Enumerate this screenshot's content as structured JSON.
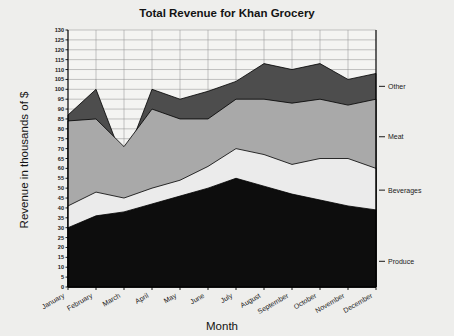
{
  "chart_data": {
    "type": "area",
    "stacked": true,
    "title": "Total Revenue for Khan Grocery",
    "xlabel": "Month",
    "ylabel": "Revenue in thousands of $",
    "categories": [
      "January",
      "February",
      "March",
      "April",
      "May",
      "June",
      "July",
      "August",
      "September",
      "October",
      "November",
      "December"
    ],
    "ylim": [
      0,
      130
    ],
    "ytick_step": 5,
    "yticks": [
      0,
      5,
      10,
      15,
      20,
      25,
      30,
      35,
      40,
      45,
      50,
      55,
      60,
      65,
      70,
      75,
      80,
      85,
      90,
      95,
      100,
      105,
      110,
      115,
      120,
      125,
      130
    ],
    "grid": true,
    "legend_position": "right-inline",
    "series": [
      {
        "name": "Produce",
        "color": "#0d0d0d",
        "values": [
          30,
          36,
          38,
          42,
          46,
          50,
          55,
          51,
          47,
          44,
          41,
          39
        ],
        "cumulative": [
          30,
          36,
          38,
          42,
          46,
          50,
          55,
          51,
          47,
          44,
          41,
          39
        ]
      },
      {
        "name": "Beverages",
        "color": "#ebebeb",
        "values": [
          11,
          12,
          7,
          8,
          8,
          11,
          15,
          16,
          15,
          21,
          24,
          21
        ],
        "cumulative": [
          41,
          48,
          45,
          50,
          54,
          61,
          70,
          67,
          62,
          65,
          65,
          60
        ]
      },
      {
        "name": "Meat",
        "color": "#a9a9a9",
        "values": [
          43,
          37,
          26,
          40,
          31,
          24,
          25,
          28,
          31,
          30,
          27,
          35
        ],
        "cumulative": [
          84,
          85,
          71,
          90,
          85,
          85,
          95,
          95,
          93,
          95,
          92,
          95
        ]
      },
      {
        "name": "Other",
        "color": "#4d4d4d",
        "values": [
          3,
          15,
          -8,
          10,
          10,
          14,
          9,
          18,
          17,
          18,
          13,
          13
        ],
        "cumulative": [
          87,
          100,
          63,
          100,
          95,
          99,
          104,
          113,
          110,
          113,
          105,
          108
        ]
      }
    ],
    "totals": [
      87,
      100,
      63,
      100,
      95,
      99,
      104,
      113,
      110,
      113,
      105,
      108
    ],
    "legend_entries": [
      {
        "label": "Other",
        "value_at_right": 101.5
      },
      {
        "label": "Meat",
        "value_at_right": 76
      },
      {
        "label": "Beverages",
        "value_at_right": 49
      },
      {
        "label": "Produce",
        "value_at_right": 13
      }
    ]
  },
  "colors": {
    "background": "#eeeeec",
    "plot_background": "#f4f4f2",
    "gridline": "#8d8d8d",
    "axis": "#000000",
    "text": "#131313"
  }
}
